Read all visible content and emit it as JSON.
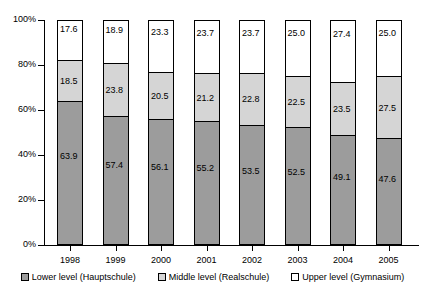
{
  "chart_data": {
    "type": "bar",
    "stacked": true,
    "normalized": "percent",
    "title": "",
    "subtitle": "",
    "xlabel": "",
    "ylabel": "",
    "categories": [
      "1998",
      "1999",
      "2000",
      "2001",
      "2002",
      "2003",
      "2004",
      "2005"
    ],
    "ylim": [
      0,
      100
    ],
    "yticks": [
      "0%",
      "20%",
      "40%",
      "60%",
      "80%",
      "100%"
    ],
    "ytick_values": [
      0,
      20,
      40,
      60,
      80,
      100
    ],
    "grid": false,
    "legend_position": "bottom",
    "series": [
      {
        "name": "Lower level (Hauptschule)",
        "color": "#9c9c9c",
        "values": [
          63.9,
          57.4,
          56.1,
          55.2,
          53.5,
          52.5,
          49.1,
          47.6
        ]
      },
      {
        "name": "Middle level (Realschule)",
        "color": "#d5d5d5",
        "values": [
          18.5,
          23.8,
          20.5,
          21.2,
          22.8,
          22.5,
          23.5,
          27.5
        ]
      },
      {
        "name": "Upper level (Gymnasium)",
        "color": "#ffffff",
        "values": [
          17.6,
          18.9,
          23.3,
          23.7,
          23.7,
          25.0,
          27.4,
          25.0
        ]
      }
    ]
  }
}
